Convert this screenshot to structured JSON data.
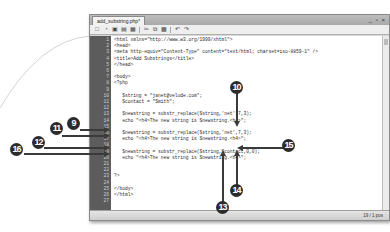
{
  "window": {
    "tab_title": "add_substring.php*",
    "controls": "_ ▫ ×"
  },
  "toolbar": {
    "icons": [
      "new-file-icon",
      "open-icon",
      "save-icon",
      "save-all-icon",
      "cut-icon",
      "copy-icon",
      "paste-icon",
      "undo-icon",
      "redo-icon"
    ]
  },
  "editor": {
    "lines": [
      {
        "n": "1",
        "code": "<html xmlns=\"http://www.w3.org/1999/xhtml\">"
      },
      {
        "n": "2",
        "code": "<head>"
      },
      {
        "n": "3",
        "code": "<meta http-equiv=\"Content-Type\" content=\"text/html; charset=iso-8859-1\" />"
      },
      {
        "n": "4",
        "code": "<title>Add Substrings</title>"
      },
      {
        "n": "5",
        "code": "</head>"
      },
      {
        "n": "6",
        "code": ""
      },
      {
        "n": "7",
        "code": "<body>"
      },
      {
        "n": "8",
        "code": "<?php"
      },
      {
        "n": "9",
        "code": ""
      },
      {
        "n": "10",
        "code": "   $string = \"janet@velude.com\";"
      },
      {
        "n": "11",
        "code": "   $contact = \"Smith\";"
      },
      {
        "n": "12",
        "code": ""
      },
      {
        "n": "13",
        "code": "   $newstring = substr_replace($string,'net',7,3);"
      },
      {
        "n": "14",
        "code": "   echo \"<h4>The new string is $newstring.<h4>\";"
      },
      {
        "n": "15",
        "code": ""
      },
      {
        "n": "16",
        "code": "   $newstring = substr_replace($string,'net',7,3);"
      },
      {
        "n": "17",
        "code": "   echo \"<h4>The new string is $newstring.<h4>\";"
      },
      {
        "n": "18",
        "code": ""
      },
      {
        "n": "19",
        "code": "   $newstring = substr_replace($string,$contact,0,0);"
      },
      {
        "n": "20",
        "code": "   echo \"<h4>The new string is $newstring.<h4>\";"
      },
      {
        "n": "21",
        "code": ""
      },
      {
        "n": "22",
        "code": ""
      },
      {
        "n": "23",
        "code": "?>"
      },
      {
        "n": "24",
        "code": ""
      },
      {
        "n": "25",
        "code": "</body>"
      },
      {
        "n": "26",
        "code": "</html>"
      },
      {
        "n": "27",
        "code": ""
      }
    ]
  },
  "statusbar": {
    "position": "19 / 1 pos"
  },
  "callouts": [
    {
      "label": "9"
    },
    {
      "label": "10"
    },
    {
      "label": "11"
    },
    {
      "label": "12"
    },
    {
      "label": "13"
    },
    {
      "label": "14"
    },
    {
      "label": "15"
    },
    {
      "label": "16"
    }
  ]
}
